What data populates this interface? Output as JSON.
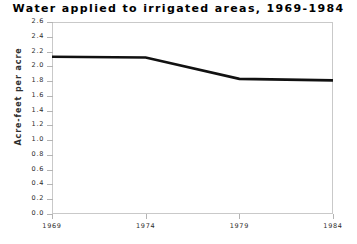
{
  "chart_data": {
    "type": "line",
    "title": "Water applied to irrigated areas, 1969-1984",
    "xlabel": "",
    "ylabel": "Acre-feet per acre",
    "x": [
      1969,
      1974,
      1979,
      1984
    ],
    "categories": [
      "1969",
      "1974",
      "1979",
      "1984"
    ],
    "values": [
      2.13,
      2.12,
      1.83,
      1.81
    ],
    "series": [
      {
        "name": "Acre-feet per acre",
        "values": [
          2.13,
          2.12,
          1.83,
          1.81
        ]
      }
    ],
    "xlim": [
      1969,
      1984
    ],
    "ylim": [
      0.0,
      2.6
    ],
    "xticks": [
      "1969",
      "1974",
      "1979",
      "1984"
    ],
    "yticks": [
      "0.0",
      "0.2",
      "0.4",
      "0.6",
      "0.8",
      "1.0",
      "1.2",
      "1.4",
      "1.6",
      "1.8",
      "2.0",
      "2.2",
      "2.4",
      "2.6"
    ],
    "grid": false,
    "legend": "none",
    "line_color": "#111111",
    "frame_color": "#c9c9c9",
    "background": "#ffffff"
  }
}
